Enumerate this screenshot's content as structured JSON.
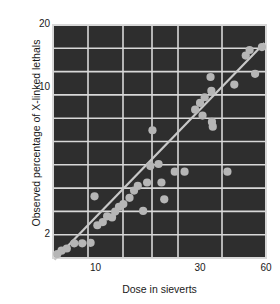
{
  "chart_data": {
    "type": "scatter",
    "title": "",
    "xlabel": "Dose in sieverts",
    "ylabel": "Observed percentage of X-linked lethals",
    "xscale": "log",
    "yscale": "log",
    "xlim": [
      6.4,
      60
    ],
    "ylim": [
      1.55,
      20
    ],
    "xticks": [
      10,
      30,
      60
    ],
    "xtick_labels": [
      "10",
      "30",
      "60"
    ],
    "yticks": [
      2,
      10,
      20
    ],
    "ytick_labels": [
      "2",
      "10",
      "20"
    ],
    "grid": true,
    "grid_color": "#d8d8d8",
    "background_color": "#2e2e2e",
    "point_color": "#b6b6b6",
    "line_color": "#c8c8c8",
    "legend": "none",
    "series": [
      {
        "name": "Observed lethals",
        "marker": "circle",
        "points": [
          [
            6.7,
            1.62
          ],
          [
            7.0,
            1.68
          ],
          [
            7.4,
            1.72
          ],
          [
            8.0,
            1.82
          ],
          [
            8.7,
            1.82
          ],
          [
            9.5,
            1.83
          ],
          [
            9.9,
            3.05
          ],
          [
            10.2,
            2.22
          ],
          [
            10.8,
            2.3
          ],
          [
            11.3,
            2.45
          ],
          [
            11.9,
            2.42
          ],
          [
            12.3,
            2.58
          ],
          [
            12.8,
            2.72
          ],
          [
            13.4,
            2.8
          ],
          [
            14.3,
            3.0
          ],
          [
            15.0,
            3.25
          ],
          [
            15.6,
            3.42
          ],
          [
            16.5,
            2.6
          ],
          [
            17.2,
            3.55
          ],
          [
            17.8,
            4.25
          ],
          [
            18.2,
            6.3
          ],
          [
            19.4,
            4.35
          ],
          [
            20.0,
            3.55
          ],
          [
            20.6,
            2.95
          ],
          [
            23.0,
            4.0
          ],
          [
            25.5,
            4.0
          ],
          [
            28.5,
            7.9
          ],
          [
            30.0,
            8.5
          ],
          [
            30.8,
            7.4
          ],
          [
            31.5,
            9.05
          ],
          [
            33.5,
            11.3
          ],
          [
            33.8,
            9.7
          ],
          [
            34.0,
            6.9
          ],
          [
            34.3,
            6.55
          ],
          [
            40.0,
            4.0
          ],
          [
            43.0,
            10.4
          ],
          [
            48.5,
            14.3
          ],
          [
            50.5,
            15.2
          ],
          [
            53.5,
            11.7
          ],
          [
            57.5,
            15.7
          ]
        ]
      }
    ],
    "fit_line": {
      "name": "regression",
      "from": [
        6.5,
        1.52
      ],
      "to": [
        59.0,
        16.4
      ]
    }
  },
  "meta": {
    "point_radius_px": 4.1
  }
}
